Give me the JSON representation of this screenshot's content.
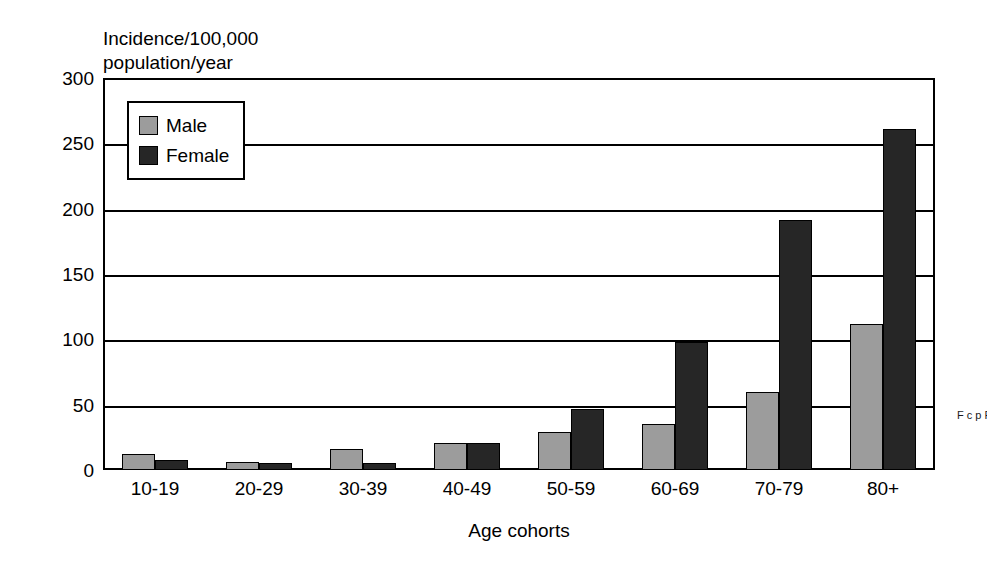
{
  "chart_data": {
    "type": "bar",
    "title": "",
    "subtitle": "",
    "xlabel": "Age cohorts",
    "ylabel": "Incidence/100,000 population/year",
    "ylabel_lines": [
      "Incidence/100,000",
      "population/year"
    ],
    "categories": [
      "10-19",
      "20-29",
      "30-39",
      "40-49",
      "50-59",
      "60-69",
      "70-79",
      "80+"
    ],
    "series": [
      {
        "name": "Male",
        "color": "#9c9c9c",
        "values": [
          12,
          6,
          16,
          21,
          29,
          35,
          60,
          112
        ]
      },
      {
        "name": "Female",
        "color": "#262626",
        "values": [
          8,
          5,
          5,
          21,
          47,
          98,
          191,
          261
        ]
      }
    ],
    "ylim": [
      0,
      300
    ],
    "yticks": [
      0,
      50,
      100,
      150,
      200,
      250,
      300
    ],
    "ytick_labels": [
      "0",
      "50",
      "100",
      "150",
      "200",
      "250",
      "300"
    ],
    "grid": true,
    "grid_axis": "y",
    "legend_position": "upper-left-inside",
    "bar_edge_color": "#000000",
    "frame_color": "#000000",
    "background": "#ffffff"
  },
  "legend": {
    "entries": [
      {
        "label": "Male",
        "color": "#9c9c9c"
      },
      {
        "label": "Female",
        "color": "#262626"
      }
    ]
  },
  "margin": {
    "clipped_text": "F c p F i"
  }
}
